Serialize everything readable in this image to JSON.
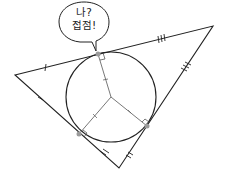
{
  "diagram": {
    "type": "incircle-of-triangle",
    "speech_bubble": {
      "line1": "나?",
      "line2": "접점!"
    },
    "triangle": {
      "vertices": {
        "left": [
          15,
          75
        ],
        "top_right": [
          213,
          26
        ],
        "bottom": [
          119,
          168
        ]
      }
    },
    "incircle": {
      "center": [
        111,
        97
      ],
      "radius": 45
    },
    "tangent_points": [
      [
        98,
        54
      ],
      [
        79,
        134
      ],
      [
        147,
        126
      ]
    ],
    "colors": {
      "stroke": "#222222",
      "radius_stroke": "#555555",
      "point_fill": "#9a9a9a"
    },
    "tick_marks": {
      "single": "left vertex tangent segments",
      "double": "bottom vertex tangent segments",
      "triple": "top-right vertex tangent segments",
      "radius": "single ticks on each radius"
    }
  }
}
